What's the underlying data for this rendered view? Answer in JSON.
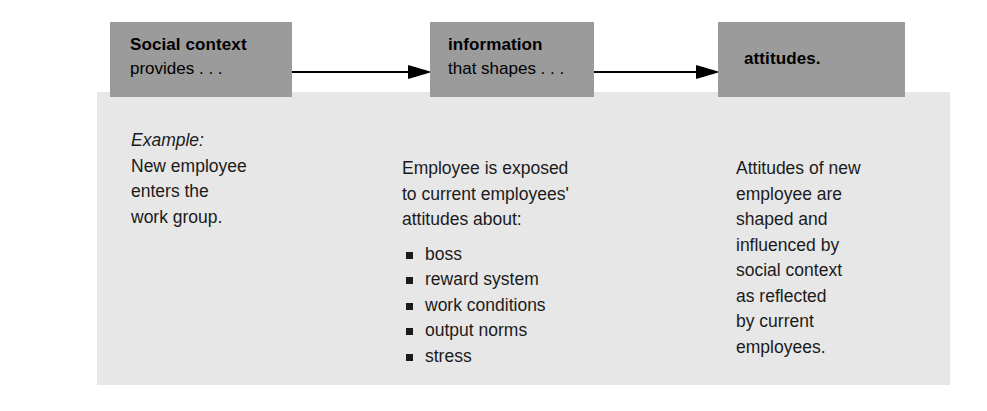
{
  "figure": {
    "colors": {
      "box_fill": "#9b9b9b",
      "panel_fill": "#e7e7e7",
      "text": "#1b1b1b",
      "arrow": "#000000",
      "page": "#ffffff"
    },
    "boxes": [
      {
        "title": "Social context",
        "subtitle": "provides . . ."
      },
      {
        "title": "information",
        "subtitle": "that shapes . . ."
      },
      {
        "title": "attitudes.",
        "subtitle": ""
      }
    ],
    "columns": {
      "left": {
        "label": "Example:",
        "lines": [
          "New employee",
          "enters the",
          "work group."
        ]
      },
      "middle": {
        "lines": [
          "Employee is exposed",
          "to current employees'",
          "attitudes about:"
        ],
        "bullets": [
          "boss",
          "reward system",
          "work conditions",
          "output norms",
          "stress"
        ]
      },
      "right": {
        "lines": [
          "Attitudes of new",
          "employee are",
          "shaped and",
          "influenced by",
          "social context",
          "as reflected",
          "by current",
          "employees."
        ]
      }
    }
  }
}
